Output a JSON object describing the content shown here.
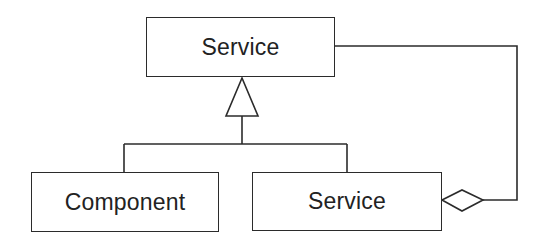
{
  "diagram": {
    "type": "uml-class-diagram",
    "pattern": "decorator-like (generalization + aggregation)",
    "nodes": [
      {
        "id": "service_top",
        "label": "Service",
        "x": 146,
        "y": 17,
        "w": 189,
        "h": 60
      },
      {
        "id": "component",
        "label": "Component",
        "x": 31,
        "y": 172,
        "w": 188,
        "h": 60
      },
      {
        "id": "service_bottom",
        "label": "Service",
        "x": 252,
        "y": 172,
        "w": 190,
        "h": 59
      }
    ],
    "edges": [
      {
        "from": "component",
        "to": "service_top",
        "kind": "generalization",
        "arrow": "hollow-triangle"
      },
      {
        "from": "service_bottom",
        "to": "service_top",
        "kind": "generalization",
        "arrow": "hollow-triangle"
      },
      {
        "from": "service_bottom",
        "to": "service_top",
        "kind": "aggregation",
        "arrow": "hollow-diamond-at-service_bottom"
      }
    ],
    "colors": {
      "line": "#2b2b2b",
      "text": "#222222",
      "background": "#ffffff"
    }
  }
}
